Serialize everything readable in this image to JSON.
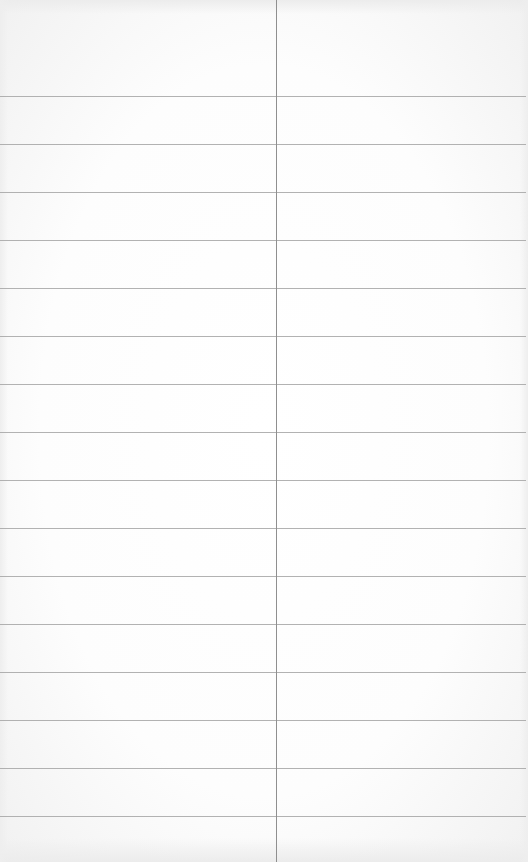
{
  "sheet": {
    "type": "ruled-two-column-page",
    "columns": 2,
    "rows": [
      {
        "left": "",
        "right": ""
      },
      {
        "left": "",
        "right": ""
      },
      {
        "left": "",
        "right": ""
      },
      {
        "left": "",
        "right": ""
      },
      {
        "left": "",
        "right": ""
      },
      {
        "left": "",
        "right": ""
      },
      {
        "left": "",
        "right": ""
      },
      {
        "left": "",
        "right": ""
      },
      {
        "left": "",
        "right": ""
      },
      {
        "left": "",
        "right": ""
      },
      {
        "left": "",
        "right": ""
      },
      {
        "left": "",
        "right": ""
      },
      {
        "left": "",
        "right": ""
      },
      {
        "left": "",
        "right": ""
      },
      {
        "left": "",
        "right": ""
      },
      {
        "left": "",
        "right": ""
      },
      {
        "left": "",
        "right": ""
      }
    ],
    "colors": {
      "paper": "#fbfbfb",
      "rule": "#a4a4a4",
      "divider": "#8f8f8f"
    }
  }
}
